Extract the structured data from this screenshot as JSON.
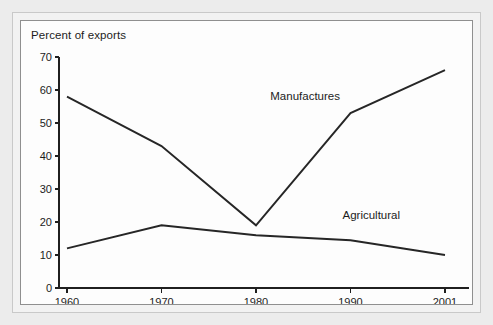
{
  "figure": {
    "title": "Percent of exports",
    "background_color": "#ececec",
    "card_color": "#fdfdfd",
    "frame_color": "#8f8f8f",
    "line_color": "#262626"
  },
  "chart_data": {
    "type": "line",
    "title": "Percent of exports",
    "xlabel": "",
    "ylabel": "Percent of exports",
    "categories": [
      "1960",
      "1970",
      "1980",
      "1990",
      "2001"
    ],
    "x_tick_labels": [
      "1960",
      "1970",
      "1980",
      "1990",
      "2001"
    ],
    "y_tick_labels": [
      "0",
      "10",
      "20",
      "30",
      "40",
      "50",
      "60",
      "70"
    ],
    "y_ticks": [
      0,
      10,
      20,
      30,
      40,
      50,
      60,
      70
    ],
    "ylim": [
      0,
      70
    ],
    "grid": false,
    "legend": "inline-labels",
    "series": [
      {
        "name": "Manufactures",
        "label": "Manufactures",
        "values": [
          58,
          43,
          19,
          53,
          66
        ],
        "color": "#262626"
      },
      {
        "name": "Agricultural",
        "label": "Agricultural",
        "values": [
          12,
          19,
          16,
          14.5,
          10
        ],
        "color": "#262626"
      }
    ],
    "annotations": [
      {
        "text": "Manufactures",
        "x": "1985",
        "y": 57
      },
      {
        "text": "Agricultural",
        "x": "1993",
        "y": 21
      }
    ]
  }
}
